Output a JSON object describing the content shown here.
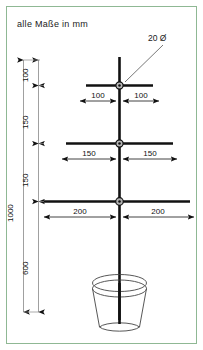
{
  "drawing": {
    "title_note": "alle Maße in mm",
    "diameter_callout": "20 Ø",
    "frame_color": "#8FB894",
    "line_color": "#111111",
    "background_color": "#ffffff",
    "units": "mm"
  },
  "vertical_dimensions": {
    "overall": {
      "label": "1000",
      "from_mm": 0,
      "to_mm": 1000
    },
    "segments": [
      {
        "label": "100",
        "value_mm": 100,
        "description": "mast-top-to-upper-crossbar"
      },
      {
        "label": "150",
        "value_mm": 150,
        "description": "upper-crossbar-to-middle-crossbar"
      },
      {
        "label": "150",
        "value_mm": 150,
        "description": "middle-crossbar-to-lower-crossbar"
      },
      {
        "label": "600",
        "value_mm": 600,
        "description": "lower-crossbar-to-mast-bottom"
      }
    ]
  },
  "horizontal_dimensions": [
    {
      "name": "upper-crossbar",
      "left_label": "100",
      "right_label": "100",
      "left_value_mm": 100,
      "right_value_mm": 100
    },
    {
      "name": "middle-crossbar",
      "left_label": "150",
      "right_label": "150",
      "left_value_mm": 150,
      "right_value_mm": 150
    },
    {
      "name": "lower-crossbar",
      "left_label": "200",
      "right_label": "200",
      "left_value_mm": 200,
      "right_value_mm": 200
    }
  ],
  "components": {
    "mast": {
      "name": "vertical-mast",
      "diameter_label": "20 Ø"
    },
    "crossbars": [
      {
        "name": "upper-crossbar"
      },
      {
        "name": "middle-crossbar"
      },
      {
        "name": "lower-crossbar"
      }
    ],
    "hubs": [
      {
        "name": "upper-hub-node"
      },
      {
        "name": "middle-hub-node"
      },
      {
        "name": "lower-hub-node"
      }
    ],
    "base": {
      "name": "flower-pot-base"
    }
  }
}
